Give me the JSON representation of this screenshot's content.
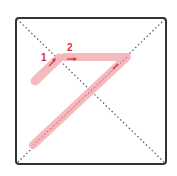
{
  "diagram": {
    "type": "stroke-order",
    "character": "ア",
    "stroke_count": 2,
    "colors": {
      "frame": "#333333",
      "guide": "#555555",
      "stroke_fill": "#f4b3b8",
      "label": "#d8323c",
      "arrow": "#d8323c"
    },
    "strokes": [
      {
        "number": "1",
        "direction": "up-right"
      },
      {
        "number": "2",
        "direction": "right-then-down-left"
      }
    ]
  }
}
